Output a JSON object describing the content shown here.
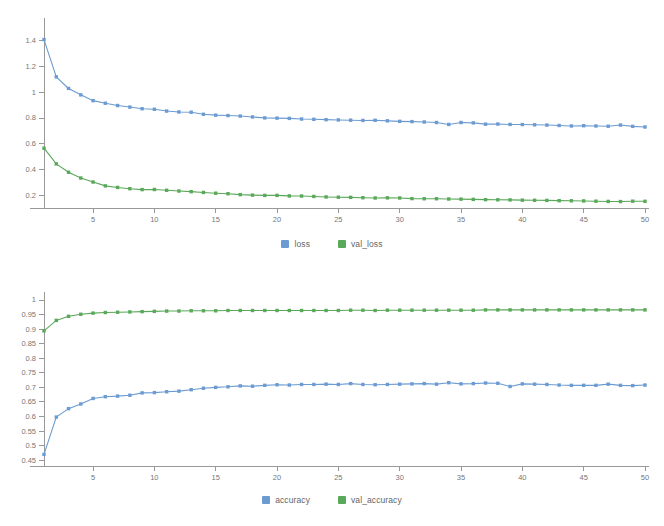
{
  "colors": {
    "series_blue": "#6c9bd2",
    "series_green": "#5aa85a",
    "axis": "#999999",
    "tick_text": "#777777",
    "legend_text": "#666666",
    "background": "#ffffff"
  },
  "legend_loss": {
    "items": [
      {
        "label": "loss",
        "color": "#6c9bd2"
      },
      {
        "label": "val_loss",
        "color": "#5aa85a"
      }
    ]
  },
  "legend_accuracy": {
    "items": [
      {
        "label": "accuracy",
        "color": "#6c9bd2"
      },
      {
        "label": "val_accuracy",
        "color": "#5aa85a"
      }
    ]
  },
  "chart_data": [
    {
      "type": "line",
      "title": "",
      "xlabel": "",
      "ylabel": "",
      "grid": false,
      "legend_position": "bottom",
      "xlim": [
        1,
        50
      ],
      "ylim": [
        0.1,
        1.5
      ],
      "xticks": [
        5,
        10,
        15,
        20,
        25,
        30,
        35,
        40,
        45,
        50
      ],
      "xticklabels": [
        "5",
        "10",
        "15",
        "20",
        "25",
        "30",
        "35",
        "40",
        "45",
        "50"
      ],
      "yticks": [
        0.2,
        0.4,
        0.6,
        0.8,
        1,
        1.2,
        1.4
      ],
      "yticklabels": [
        "0.2",
        "0.4",
        "0.6",
        "0.8",
        "1",
        "1.2",
        "1.4"
      ],
      "x": [
        1,
        2,
        3,
        4,
        5,
        6,
        7,
        8,
        9,
        10,
        11,
        12,
        13,
        14,
        15,
        16,
        17,
        18,
        19,
        20,
        21,
        22,
        23,
        24,
        25,
        26,
        27,
        28,
        29,
        30,
        31,
        32,
        33,
        34,
        35,
        36,
        37,
        38,
        39,
        40,
        41,
        42,
        43,
        44,
        45,
        46,
        47,
        48,
        49,
        50
      ],
      "series": [
        {
          "name": "loss",
          "color": "#6c9bd2",
          "values": [
            1.41,
            1.12,
            1.03,
            0.98,
            0.935,
            0.915,
            0.897,
            0.885,
            0.872,
            0.868,
            0.854,
            0.847,
            0.845,
            0.829,
            0.822,
            0.819,
            0.815,
            0.808,
            0.801,
            0.799,
            0.797,
            0.792,
            0.79,
            0.787,
            0.785,
            0.783,
            0.781,
            0.782,
            0.778,
            0.774,
            0.772,
            0.769,
            0.765,
            0.75,
            0.765,
            0.762,
            0.752,
            0.753,
            0.75,
            0.749,
            0.747,
            0.745,
            0.742,
            0.738,
            0.74,
            0.738,
            0.736,
            0.745,
            0.735,
            0.73
          ]
        },
        {
          "name": "val_loss",
          "color": "#5aa85a",
          "values": [
            0.565,
            0.443,
            0.378,
            0.333,
            0.302,
            0.272,
            0.26,
            0.25,
            0.243,
            0.244,
            0.238,
            0.232,
            0.227,
            0.221,
            0.215,
            0.211,
            0.204,
            0.2,
            0.198,
            0.198,
            0.194,
            0.193,
            0.19,
            0.186,
            0.184,
            0.183,
            0.18,
            0.178,
            0.179,
            0.178,
            0.173,
            0.172,
            0.172,
            0.17,
            0.169,
            0.167,
            0.165,
            0.164,
            0.163,
            0.161,
            0.16,
            0.159,
            0.157,
            0.156,
            0.155,
            0.153,
            0.151,
            0.15,
            0.153,
            0.152
          ]
        }
      ]
    },
    {
      "type": "line",
      "title": "",
      "xlabel": "",
      "ylabel": "",
      "grid": false,
      "legend_position": "bottom",
      "xlim": [
        1,
        50
      ],
      "ylim": [
        0.43,
        1.0
      ],
      "xticks": [
        5,
        10,
        15,
        20,
        25,
        30,
        35,
        40,
        45,
        50
      ],
      "xticklabels": [
        "5",
        "10",
        "15",
        "20",
        "25",
        "30",
        "35",
        "40",
        "45",
        "50"
      ],
      "yticks": [
        0.45,
        0.5,
        0.55,
        0.6,
        0.65,
        0.7,
        0.75,
        0.8,
        0.85,
        0.9,
        0.95,
        1
      ],
      "yticklabels": [
        "0.45",
        "0.5",
        "0.55",
        "0.6",
        "0.65",
        "0.7",
        "0.75",
        "0.8",
        "0.85",
        "0.9",
        "0.95",
        "1"
      ],
      "x": [
        1,
        2,
        3,
        4,
        5,
        6,
        7,
        8,
        9,
        10,
        11,
        12,
        13,
        14,
        15,
        16,
        17,
        18,
        19,
        20,
        21,
        22,
        23,
        24,
        25,
        26,
        27,
        28,
        29,
        30,
        31,
        32,
        33,
        34,
        35,
        36,
        37,
        38,
        39,
        40,
        41,
        42,
        43,
        44,
        45,
        46,
        47,
        48,
        49,
        50
      ],
      "series": [
        {
          "name": "accuracy",
          "color": "#6c9bd2",
          "values": [
            0.47,
            0.598,
            0.627,
            0.643,
            0.662,
            0.668,
            0.67,
            0.673,
            0.681,
            0.682,
            0.685,
            0.687,
            0.692,
            0.697,
            0.7,
            0.702,
            0.705,
            0.704,
            0.707,
            0.709,
            0.708,
            0.71,
            0.71,
            0.711,
            0.71,
            0.713,
            0.71,
            0.709,
            0.71,
            0.711,
            0.712,
            0.713,
            0.711,
            0.716,
            0.712,
            0.713,
            0.715,
            0.714,
            0.703,
            0.712,
            0.711,
            0.71,
            0.708,
            0.707,
            0.707,
            0.707,
            0.711,
            0.707,
            0.706,
            0.708
          ]
        },
        {
          "name": "val_accuracy",
          "color": "#5aa85a",
          "values": [
            0.894,
            0.93,
            0.944,
            0.951,
            0.955,
            0.957,
            0.958,
            0.959,
            0.96,
            0.961,
            0.962,
            0.962,
            0.963,
            0.963,
            0.963,
            0.964,
            0.964,
            0.964,
            0.964,
            0.964,
            0.964,
            0.964,
            0.964,
            0.964,
            0.964,
            0.965,
            0.965,
            0.964,
            0.965,
            0.965,
            0.965,
            0.965,
            0.965,
            0.965,
            0.965,
            0.965,
            0.966,
            0.966,
            0.966,
            0.966,
            0.966,
            0.966,
            0.966,
            0.966,
            0.966,
            0.966,
            0.966,
            0.966,
            0.966,
            0.966
          ]
        }
      ]
    }
  ]
}
